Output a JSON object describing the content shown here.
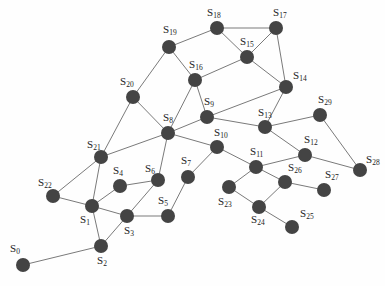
{
  "diagram": {
    "type": "network-graph",
    "node_color": "#444444",
    "edge_color": "#7a7a7a",
    "nodes": [
      {
        "id": "S0",
        "base": "S",
        "sub": "0",
        "x": 23,
        "y": 265,
        "lx": 10,
        "ly": 252
      },
      {
        "id": "S1",
        "base": "S",
        "sub": "1",
        "x": 92,
        "y": 206,
        "lx": 80,
        "ly": 223
      },
      {
        "id": "S2",
        "base": "S",
        "sub": "2",
        "x": 101,
        "y": 246,
        "lx": 97,
        "ly": 264
      },
      {
        "id": "S3",
        "base": "S",
        "sub": "3",
        "x": 127,
        "y": 216,
        "lx": 124,
        "ly": 234
      },
      {
        "id": "S4",
        "base": "S",
        "sub": "4",
        "x": 120,
        "y": 186,
        "lx": 113,
        "ly": 174
      },
      {
        "id": "S5",
        "base": "S",
        "sub": "5",
        "x": 168,
        "y": 216,
        "lx": 158,
        "ly": 204
      },
      {
        "id": "S6",
        "base": "S",
        "sub": "6",
        "x": 158,
        "y": 180,
        "lx": 145,
        "ly": 172
      },
      {
        "id": "S7",
        "base": "S",
        "sub": "7",
        "x": 188,
        "y": 177,
        "lx": 181,
        "ly": 164
      },
      {
        "id": "S8",
        "base": "S",
        "sub": "8",
        "x": 168,
        "y": 133,
        "lx": 163,
        "ly": 121
      },
      {
        "id": "S9",
        "base": "S",
        "sub": "9",
        "x": 207,
        "y": 117,
        "lx": 204,
        "ly": 105
      },
      {
        "id": "S10",
        "base": "S",
        "sub": "10",
        "x": 217,
        "y": 147,
        "lx": 214,
        "ly": 136
      },
      {
        "id": "S11",
        "base": "S",
        "sub": "11",
        "x": 256,
        "y": 167,
        "lx": 250,
        "ly": 155
      },
      {
        "id": "S12",
        "base": "S",
        "sub": "12",
        "x": 305,
        "y": 155,
        "lx": 304,
        "ly": 143
      },
      {
        "id": "S13",
        "base": "S",
        "sub": "13",
        "x": 265,
        "y": 127,
        "lx": 258,
        "ly": 116
      },
      {
        "id": "S14",
        "base": "S",
        "sub": "14",
        "x": 286,
        "y": 87,
        "lx": 293,
        "ly": 79
      },
      {
        "id": "S15",
        "base": "S",
        "sub": "15",
        "x": 247,
        "y": 57,
        "lx": 240,
        "ly": 45
      },
      {
        "id": "S16",
        "base": "S",
        "sub": "16",
        "x": 195,
        "y": 80,
        "lx": 189,
        "ly": 68
      },
      {
        "id": "S17",
        "base": "S",
        "sub": "17",
        "x": 276,
        "y": 28,
        "lx": 273,
        "ly": 16
      },
      {
        "id": "S18",
        "base": "S",
        "sub": "18",
        "x": 217,
        "y": 28,
        "lx": 207,
        "ly": 16
      },
      {
        "id": "S19",
        "base": "S",
        "sub": "19",
        "x": 169,
        "y": 47,
        "lx": 163,
        "ly": 33
      },
      {
        "id": "S20",
        "base": "S",
        "sub": "20",
        "x": 133,
        "y": 97,
        "lx": 120,
        "ly": 85
      },
      {
        "id": "S21",
        "base": "S",
        "sub": "21",
        "x": 101,
        "y": 157,
        "lx": 87,
        "ly": 148
      },
      {
        "id": "S22",
        "base": "S",
        "sub": "22",
        "x": 53,
        "y": 196,
        "lx": 38,
        "ly": 186
      },
      {
        "id": "S23",
        "base": "S",
        "sub": "23",
        "x": 229,
        "y": 187,
        "lx": 218,
        "ly": 205
      },
      {
        "id": "S24",
        "base": "S",
        "sub": "24",
        "x": 259,
        "y": 207,
        "lx": 251,
        "ly": 223
      },
      {
        "id": "S25",
        "base": "S",
        "sub": "25",
        "x": 292,
        "y": 227,
        "lx": 300,
        "ly": 217
      },
      {
        "id": "S26",
        "base": "S",
        "sub": "26",
        "x": 285,
        "y": 182,
        "lx": 288,
        "ly": 171
      },
      {
        "id": "S27",
        "base": "S",
        "sub": "27",
        "x": 324,
        "y": 190,
        "lx": 325,
        "ly": 178
      },
      {
        "id": "S28",
        "base": "S",
        "sub": "28",
        "x": 360,
        "y": 170,
        "lx": 366,
        "ly": 163
      },
      {
        "id": "S29",
        "base": "S",
        "sub": "29",
        "x": 320,
        "y": 115,
        "lx": 318,
        "ly": 103
      }
    ],
    "edges": [
      [
        "S0",
        "S2"
      ],
      [
        "S2",
        "S1"
      ],
      [
        "S2",
        "S3"
      ],
      [
        "S1",
        "S3"
      ],
      [
        "S1",
        "S4"
      ],
      [
        "S1",
        "S22"
      ],
      [
        "S1",
        "S21"
      ],
      [
        "S22",
        "S21"
      ],
      [
        "S4",
        "S6"
      ],
      [
        "S3",
        "S6"
      ],
      [
        "S3",
        "S5"
      ],
      [
        "S5",
        "S7"
      ],
      [
        "S6",
        "S8"
      ],
      [
        "S7",
        "S10"
      ],
      [
        "S21",
        "S8"
      ],
      [
        "S21",
        "S20"
      ],
      [
        "S20",
        "S8"
      ],
      [
        "S20",
        "S19"
      ],
      [
        "S19",
        "S16"
      ],
      [
        "S19",
        "S18"
      ],
      [
        "S16",
        "S8"
      ],
      [
        "S16",
        "S9"
      ],
      [
        "S16",
        "S15"
      ],
      [
        "S8",
        "S9"
      ],
      [
        "S8",
        "S10"
      ],
      [
        "S18",
        "S17"
      ],
      [
        "S18",
        "S15"
      ],
      [
        "S15",
        "S17"
      ],
      [
        "S15",
        "S14"
      ],
      [
        "S17",
        "S14"
      ],
      [
        "S14",
        "S9"
      ],
      [
        "S14",
        "S13"
      ],
      [
        "S9",
        "S13"
      ],
      [
        "S13",
        "S29"
      ],
      [
        "S13",
        "S12"
      ],
      [
        "S29",
        "S28"
      ],
      [
        "S12",
        "S28"
      ],
      [
        "S12",
        "S11"
      ],
      [
        "S10",
        "S11"
      ],
      [
        "S11",
        "S23"
      ],
      [
        "S11",
        "S26"
      ],
      [
        "S23",
        "S24"
      ],
      [
        "S24",
        "S26"
      ],
      [
        "S24",
        "S25"
      ],
      [
        "S26",
        "S27"
      ]
    ]
  }
}
